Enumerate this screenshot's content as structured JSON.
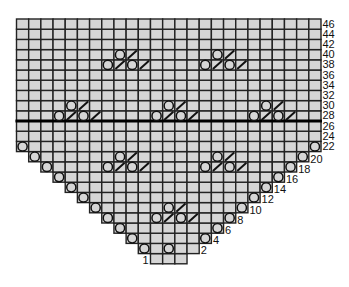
{
  "chart": {
    "title": "",
    "type": "knitting-lace-chart",
    "columns": 25,
    "grid_rows": 24,
    "cell_fill": "#d6d6d6",
    "line_color": "#222222",
    "thick_line_between_rows": [
      "26",
      "28"
    ],
    "rows": [
      {
        "label": "1",
        "label_side": "left",
        "first_col": 11,
        "last_col": 13
      },
      {
        "label": "2",
        "label_side": "right",
        "first_col": 10,
        "last_col": 14
      },
      {
        "label": "4",
        "label_side": "right",
        "first_col": 9,
        "last_col": 15
      },
      {
        "label": "6",
        "label_side": "right",
        "first_col": 8,
        "last_col": 16
      },
      {
        "label": "8",
        "label_side": "right",
        "first_col": 7,
        "last_col": 17
      },
      {
        "label": "10",
        "label_side": "right",
        "first_col": 6,
        "last_col": 18
      },
      {
        "label": "12",
        "label_side": "right",
        "first_col": 5,
        "last_col": 19
      },
      {
        "label": "14",
        "label_side": "right",
        "first_col": 4,
        "last_col": 20
      },
      {
        "label": "16",
        "label_side": "right",
        "first_col": 3,
        "last_col": 21
      },
      {
        "label": "18",
        "label_side": "right",
        "first_col": 2,
        "last_col": 22
      },
      {
        "label": "20",
        "label_side": "right",
        "first_col": 1,
        "last_col": 23
      },
      {
        "label": "22",
        "label_side": "right",
        "first_col": 0,
        "last_col": 24
      },
      {
        "label": "24",
        "label_side": "right",
        "first_col": 0,
        "last_col": 24
      },
      {
        "label": "26",
        "label_side": "right",
        "first_col": 0,
        "last_col": 24
      },
      {
        "label": "28",
        "label_side": "right",
        "first_col": 0,
        "last_col": 24
      },
      {
        "label": "30",
        "label_side": "right",
        "first_col": 0,
        "last_col": 24
      },
      {
        "label": "32",
        "label_side": "right",
        "first_col": 0,
        "last_col": 24
      },
      {
        "label": "34",
        "label_side": "right",
        "first_col": 0,
        "last_col": 24
      },
      {
        "label": "36",
        "label_side": "right",
        "first_col": 0,
        "last_col": 24
      },
      {
        "label": "38",
        "label_side": "right",
        "first_col": 0,
        "last_col": 24
      },
      {
        "label": "40",
        "label_side": "right",
        "first_col": 0,
        "last_col": 24
      },
      {
        "label": "42",
        "label_side": "right",
        "first_col": 0,
        "last_col": 24
      },
      {
        "label": "44",
        "label_side": "right",
        "first_col": 0,
        "last_col": 24
      },
      {
        "label": "46",
        "label_side": "right",
        "first_col": 0,
        "last_col": 24
      }
    ],
    "legend_symbols": {
      "O": "yarn-over",
      "/": "k2tog"
    },
    "symbols": [
      {
        "row": 1,
        "col": 10,
        "s": "O"
      },
      {
        "row": 1,
        "col": 12,
        "s": "O"
      },
      {
        "row": 2,
        "col": 9,
        "s": "O"
      },
      {
        "row": 2,
        "col": 15,
        "s": "O"
      },
      {
        "row": 3,
        "col": 8,
        "s": "O"
      },
      {
        "row": 3,
        "col": 16,
        "s": "O"
      },
      {
        "row": 4,
        "col": 7,
        "s": "O"
      },
      {
        "row": 4,
        "col": 17,
        "s": "O"
      },
      {
        "row": 4,
        "col": 11,
        "s": "O"
      },
      {
        "row": 4,
        "col": 12,
        "s": "/"
      },
      {
        "row": 4,
        "col": 13,
        "s": "O"
      },
      {
        "row": 4,
        "col": 14,
        "s": "/"
      },
      {
        "row": 5,
        "col": 6,
        "s": "O"
      },
      {
        "row": 5,
        "col": 18,
        "s": "O"
      },
      {
        "row": 5,
        "col": 12,
        "s": "O"
      },
      {
        "row": 5,
        "col": 13,
        "s": "/"
      },
      {
        "row": 6,
        "col": 5,
        "s": "O"
      },
      {
        "row": 6,
        "col": 19,
        "s": "O"
      },
      {
        "row": 7,
        "col": 4,
        "s": "O"
      },
      {
        "row": 7,
        "col": 20,
        "s": "O"
      },
      {
        "row": 8,
        "col": 3,
        "s": "O"
      },
      {
        "row": 8,
        "col": 21,
        "s": "O"
      },
      {
        "row": 9,
        "col": 2,
        "s": "O"
      },
      {
        "row": 9,
        "col": 22,
        "s": "O"
      },
      {
        "row": 9,
        "col": 7,
        "s": "O"
      },
      {
        "row": 9,
        "col": 8,
        "s": "/"
      },
      {
        "row": 9,
        "col": 9,
        "s": "O"
      },
      {
        "row": 9,
        "col": 10,
        "s": "/"
      },
      {
        "row": 9,
        "col": 15,
        "s": "O"
      },
      {
        "row": 9,
        "col": 16,
        "s": "/"
      },
      {
        "row": 9,
        "col": 17,
        "s": "O"
      },
      {
        "row": 9,
        "col": 18,
        "s": "/"
      },
      {
        "row": 10,
        "col": 1,
        "s": "O"
      },
      {
        "row": 10,
        "col": 23,
        "s": "O"
      },
      {
        "row": 10,
        "col": 8,
        "s": "O"
      },
      {
        "row": 10,
        "col": 9,
        "s": "/"
      },
      {
        "row": 10,
        "col": 16,
        "s": "O"
      },
      {
        "row": 10,
        "col": 17,
        "s": "/"
      },
      {
        "row": 11,
        "col": 0,
        "s": "O"
      },
      {
        "row": 11,
        "col": 24,
        "s": "O"
      },
      {
        "row": 14,
        "col": 3,
        "s": "O"
      },
      {
        "row": 14,
        "col": 4,
        "s": "/"
      },
      {
        "row": 14,
        "col": 5,
        "s": "O"
      },
      {
        "row": 14,
        "col": 6,
        "s": "/"
      },
      {
        "row": 14,
        "col": 11,
        "s": "O"
      },
      {
        "row": 14,
        "col": 12,
        "s": "/"
      },
      {
        "row": 14,
        "col": 13,
        "s": "O"
      },
      {
        "row": 14,
        "col": 14,
        "s": "/"
      },
      {
        "row": 14,
        "col": 19,
        "s": "O"
      },
      {
        "row": 14,
        "col": 20,
        "s": "/"
      },
      {
        "row": 14,
        "col": 21,
        "s": "O"
      },
      {
        "row": 14,
        "col": 22,
        "s": "/"
      },
      {
        "row": 15,
        "col": 4,
        "s": "O"
      },
      {
        "row": 15,
        "col": 5,
        "s": "/"
      },
      {
        "row": 15,
        "col": 12,
        "s": "O"
      },
      {
        "row": 15,
        "col": 13,
        "s": "/"
      },
      {
        "row": 15,
        "col": 20,
        "s": "O"
      },
      {
        "row": 15,
        "col": 21,
        "s": "/"
      },
      {
        "row": 19,
        "col": 7,
        "s": "O"
      },
      {
        "row": 19,
        "col": 8,
        "s": "/"
      },
      {
        "row": 19,
        "col": 9,
        "s": "O"
      },
      {
        "row": 19,
        "col": 10,
        "s": "/"
      },
      {
        "row": 19,
        "col": 15,
        "s": "O"
      },
      {
        "row": 19,
        "col": 16,
        "s": "/"
      },
      {
        "row": 19,
        "col": 17,
        "s": "O"
      },
      {
        "row": 19,
        "col": 18,
        "s": "/"
      },
      {
        "row": 20,
        "col": 8,
        "s": "O"
      },
      {
        "row": 20,
        "col": 9,
        "s": "/"
      },
      {
        "row": 20,
        "col": 16,
        "s": "O"
      },
      {
        "row": 20,
        "col": 17,
        "s": "/"
      }
    ]
  }
}
